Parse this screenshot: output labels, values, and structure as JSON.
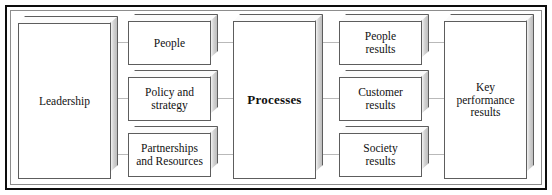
{
  "diagram": {
    "type": "process-block-diagram",
    "frame": {
      "border_color": "#0d0d0d",
      "inner_rule_color": "#8d8d8d",
      "background": "#ffffff"
    },
    "style": {
      "box_fill": "#ffffff",
      "box_border": "#5d5d5d",
      "box_side_shade": "#c9c9c9",
      "connector_color": "#b9b9b9",
      "text_color": "#111111"
    },
    "columns": [
      {
        "name": "enablers-leadership",
        "boxes": [
          {
            "id": "leadership",
            "label": "Leadership",
            "bold": false,
            "lines": [
              "Leadership"
            ]
          }
        ]
      },
      {
        "name": "enablers-middle",
        "boxes": [
          {
            "id": "people",
            "label": "People",
            "bold": false,
            "lines": [
              "People"
            ]
          },
          {
            "id": "policy-and-strategy",
            "label": "Policy and strategy",
            "bold": false,
            "lines": [
              "Policy and",
              "strategy"
            ]
          },
          {
            "id": "partnerships-and-resources",
            "label": "Partnerships and Resources",
            "bold": false,
            "lines": [
              "Partnerships",
              "and Resources"
            ]
          }
        ]
      },
      {
        "name": "processes",
        "boxes": [
          {
            "id": "processes",
            "label": "Processes",
            "bold": true,
            "lines": [
              "Processes"
            ]
          }
        ]
      },
      {
        "name": "results-middle",
        "boxes": [
          {
            "id": "people-results",
            "label": "People results",
            "bold": false,
            "lines": [
              "People",
              "results"
            ]
          },
          {
            "id": "customer-results",
            "label": "Customer results",
            "bold": false,
            "lines": [
              "Customer",
              "results"
            ]
          },
          {
            "id": "society-results",
            "label": "Society results",
            "bold": false,
            "lines": [
              "Society",
              "results"
            ]
          }
        ]
      },
      {
        "name": "key-performance",
        "boxes": [
          {
            "id": "key-performance-results",
            "label": "Key performance results",
            "bold": false,
            "lines": [
              "Key",
              "performance",
              "results"
            ]
          }
        ]
      }
    ]
  }
}
